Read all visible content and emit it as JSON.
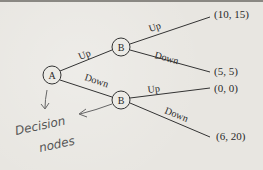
{
  "diagram": {
    "type": "game-tree",
    "root": {
      "id": "A",
      "label": "A"
    },
    "nodes": [
      {
        "id": "A",
        "label": "A"
      },
      {
        "id": "B1",
        "label": "B"
      },
      {
        "id": "B2",
        "label": "B"
      }
    ],
    "edges": [
      {
        "from": "A",
        "to": "B1",
        "label": "Up"
      },
      {
        "from": "A",
        "to": "B2",
        "label": "Down"
      },
      {
        "from": "B1",
        "to": "T1",
        "label": "Up"
      },
      {
        "from": "B1",
        "to": "T2",
        "label": "Down"
      },
      {
        "from": "B2",
        "to": "T3",
        "label": "Up"
      },
      {
        "from": "B2",
        "to": "T4",
        "label": "Down"
      }
    ],
    "payoffs": [
      {
        "id": "T1",
        "label": "(10, 15)"
      },
      {
        "id": "T2",
        "label": "(5, 5)"
      },
      {
        "id": "T3",
        "label": "(0, 0)"
      },
      {
        "id": "T4",
        "label": "(6, 20)"
      }
    ],
    "annotation": {
      "line1": "Decision",
      "line2": "nodes",
      "color": "#555555"
    }
  }
}
